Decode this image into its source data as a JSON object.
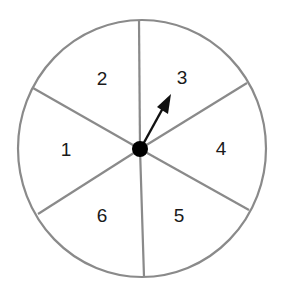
{
  "diagram": {
    "type": "spinner",
    "sector_count": 6,
    "colors": {
      "outline": "#8a8a8a",
      "arrow": "#111111",
      "hub": "#000000",
      "label": "#1a1a1a",
      "background": "#ffffff"
    },
    "sectors": [
      {
        "label": "1",
        "x": 66,
        "y": 156
      },
      {
        "label": "2",
        "x": 102,
        "y": 85
      },
      {
        "label": "3",
        "x": 182,
        "y": 84
      },
      {
        "label": "4",
        "x": 221,
        "y": 155
      },
      {
        "label": "5",
        "x": 179,
        "y": 222
      },
      {
        "label": "6",
        "x": 102,
        "y": 222
      }
    ],
    "pointer": {
      "points_to": "3"
    }
  }
}
